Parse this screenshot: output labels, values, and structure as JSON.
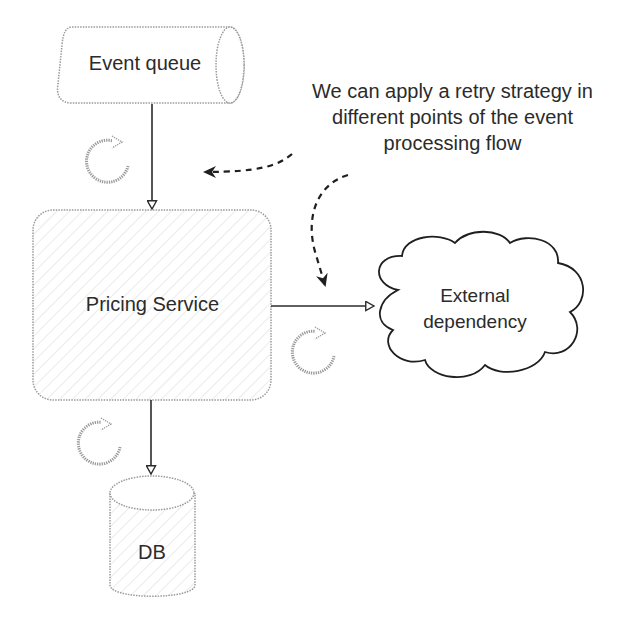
{
  "diagram": {
    "nodes": {
      "event_queue": {
        "label": "Event queue",
        "shape": "horizontal-cylinder"
      },
      "pricing_service": {
        "label": "Pricing Service",
        "shape": "rounded-rectangle"
      },
      "external_dependency": {
        "label_line1": "External",
        "label_line2": "dependency",
        "shape": "cloud"
      },
      "db": {
        "label": "DB",
        "shape": "cylinder"
      }
    },
    "annotation": {
      "text": "We can apply a retry strategy in different points of the event processing flow"
    },
    "edges": [
      {
        "from": "Event queue",
        "to": "Pricing Service",
        "style": "solid"
      },
      {
        "from": "Pricing Service",
        "to": "External dependency",
        "style": "solid"
      },
      {
        "from": "Pricing Service",
        "to": "DB",
        "style": "solid"
      }
    ],
    "retry_icons": [
      {
        "name": "retry-icon",
        "location": "between Event queue and Pricing Service"
      },
      {
        "name": "retry-icon",
        "location": "between Pricing Service and External dependency"
      },
      {
        "name": "retry-icon",
        "location": "between Pricing Service and DB"
      }
    ],
    "colors": {
      "stroke": "#2b2b2b",
      "dotted_outline": "#9a9a9a",
      "hatch": "#e3e3e3",
      "background": "#ffffff"
    }
  }
}
